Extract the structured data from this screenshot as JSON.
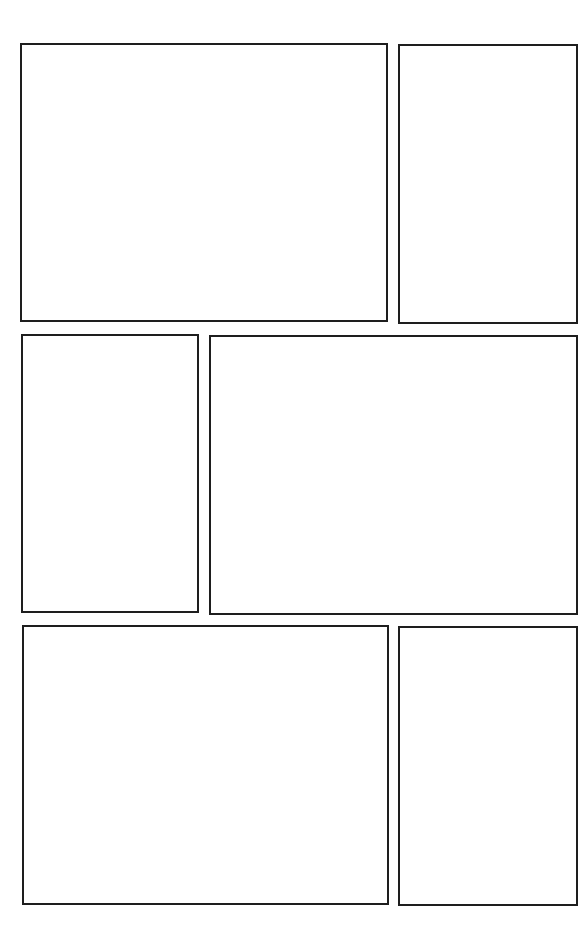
{
  "page": {
    "type": "comic-panel-template",
    "background": "#ffffff",
    "border_color": "#1e1e1e",
    "rows": [
      {
        "panels": [
          {
            "id": "panel-1",
            "x": 20,
            "y": 43,
            "w": 368,
            "h": 279,
            "content": ""
          },
          {
            "id": "panel-2",
            "x": 398,
            "y": 44,
            "w": 180,
            "h": 280,
            "content": ""
          }
        ]
      },
      {
        "panels": [
          {
            "id": "panel-3",
            "x": 21,
            "y": 334,
            "w": 178,
            "h": 279,
            "content": ""
          },
          {
            "id": "panel-4",
            "x": 209,
            "y": 335,
            "w": 369,
            "h": 280,
            "content": ""
          }
        ]
      },
      {
        "panels": [
          {
            "id": "panel-5",
            "x": 22,
            "y": 625,
            "w": 367,
            "h": 280,
            "content": ""
          },
          {
            "id": "panel-6",
            "x": 398,
            "y": 626,
            "w": 180,
            "h": 280,
            "content": ""
          }
        ]
      }
    ]
  }
}
